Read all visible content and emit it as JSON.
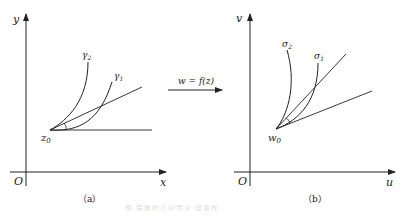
{
  "panel_a": {
    "y_axis_label": "y",
    "x_axis_label": "x",
    "origin_label": "O",
    "point_label": "z",
    "point_sub": "0",
    "curve1_label": "γ",
    "curve1_sub": "1",
    "curve2_label": "γ",
    "curve2_sub": "2",
    "caption": "（a）"
  },
  "mapping": {
    "label": "w = f(z)"
  },
  "panel_b": {
    "y_axis_label": "v",
    "x_axis_label": "u",
    "origin_label": "O",
    "point_label": "w",
    "point_sub": "0",
    "curve1_label": "σ",
    "curve1_sub": "1",
    "curve2_label": "σ",
    "curve2_sub": "2",
    "caption": "（b）"
  },
  "figure_caption": "图 导数的几何意义 保角性"
}
